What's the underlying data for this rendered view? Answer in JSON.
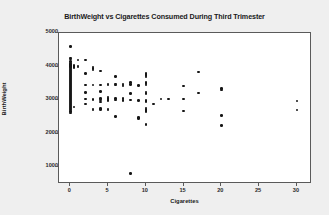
{
  "chart_data": {
    "type": "scatter",
    "title": "BirthWeight vs Cigarettes Consumed During Third Trimester",
    "xlabel": "Cigarettes",
    "ylabel": "BirthWeight",
    "xlim": [
      -1.5,
      32
    ],
    "ylim": [
      500,
      5000
    ],
    "xticks": [
      0,
      5,
      10,
      15,
      20,
      25,
      30
    ],
    "yticks": [
      1000,
      2000,
      3000,
      4000,
      5000
    ],
    "xtick_labels": [
      "0",
      "5",
      "10",
      "15",
      "20",
      "25",
      "30"
    ],
    "ytick_labels": [
      "1000",
      "2000",
      "3000",
      "4000",
      "5000"
    ],
    "grid": false,
    "legend": "none",
    "marker": "filled-circle",
    "marker_color": "#161616",
    "plot_background": "#ffffff",
    "figure_background": "#efefef",
    "points": [
      [
        0,
        4590
      ],
      [
        0,
        4260
      ],
      [
        0,
        4220
      ],
      [
        0,
        4150
      ],
      [
        0,
        4110
      ],
      [
        0,
        4080
      ],
      [
        0,
        4060
      ],
      [
        0,
        4040
      ],
      [
        0,
        4010
      ],
      [
        0,
        3990
      ],
      [
        0,
        3960
      ],
      [
        0,
        3930
      ],
      [
        0,
        3900
      ],
      [
        0,
        3870
      ],
      [
        0,
        3840
      ],
      [
        0,
        3810
      ],
      [
        0,
        3780
      ],
      [
        0,
        3750
      ],
      [
        0,
        3720
      ],
      [
        0,
        3690
      ],
      [
        0,
        3660
      ],
      [
        0,
        3630
      ],
      [
        0,
        3600
      ],
      [
        0,
        3570
      ],
      [
        0,
        3540
      ],
      [
        0,
        3510
      ],
      [
        0,
        3480
      ],
      [
        0,
        3450
      ],
      [
        0,
        3420
      ],
      [
        0,
        3390
      ],
      [
        0,
        3360
      ],
      [
        0,
        3330
      ],
      [
        0,
        3300
      ],
      [
        0,
        3270
      ],
      [
        0,
        3240
      ],
      [
        0,
        3210
      ],
      [
        0,
        3180
      ],
      [
        0,
        3150
      ],
      [
        0,
        3120
      ],
      [
        0,
        3090
      ],
      [
        0,
        3060
      ],
      [
        0,
        3030
      ],
      [
        0,
        3000
      ],
      [
        0,
        2970
      ],
      [
        0,
        2940
      ],
      [
        0,
        2910
      ],
      [
        0,
        2880
      ],
      [
        0,
        2850
      ],
      [
        0,
        2820
      ],
      [
        0,
        2790
      ],
      [
        0,
        2760
      ],
      [
        0,
        2730
      ],
      [
        0,
        2700
      ],
      [
        0,
        2660
      ],
      [
        0,
        2610
      ],
      [
        0.5,
        4030
      ],
      [
        0.5,
        4000
      ],
      [
        0.5,
        3970
      ],
      [
        0.5,
        2790
      ],
      [
        1,
        4200
      ],
      [
        1,
        4020
      ],
      [
        1,
        3990
      ],
      [
        2,
        4190
      ],
      [
        2,
        3790
      ],
      [
        2,
        3450
      ],
      [
        2,
        3230
      ],
      [
        2,
        3030
      ],
      [
        2,
        2890
      ],
      [
        3,
        3990
      ],
      [
        3,
        3940
      ],
      [
        3,
        3900
      ],
      [
        3,
        3450
      ],
      [
        3,
        3010
      ],
      [
        3,
        2730
      ],
      [
        3,
        2700
      ],
      [
        4,
        3870
      ],
      [
        4,
        3450
      ],
      [
        4,
        3250
      ],
      [
        4,
        3050
      ],
      [
        4,
        3000
      ],
      [
        4,
        2940
      ],
      [
        4,
        2750
      ],
      [
        4,
        2720
      ],
      [
        5,
        3480
      ],
      [
        5,
        3450
      ],
      [
        5,
        3090
      ],
      [
        5,
        3050
      ],
      [
        5,
        3000
      ],
      [
        5,
        2990
      ],
      [
        5,
        2730
      ],
      [
        5,
        2710
      ],
      [
        6,
        3710
      ],
      [
        6,
        3480
      ],
      [
        6,
        3450
      ],
      [
        6,
        3040
      ],
      [
        6,
        3000
      ],
      [
        6,
        2520
      ],
      [
        7,
        3480
      ],
      [
        7,
        3450
      ],
      [
        7,
        3420
      ],
      [
        7,
        3050
      ],
      [
        7,
        2990
      ],
      [
        8,
        3520
      ],
      [
        8,
        3460
      ],
      [
        8,
        3200
      ],
      [
        8,
        3000
      ],
      [
        8,
        820
      ],
      [
        9,
        3440
      ],
      [
        9,
        2990
      ],
      [
        9,
        2480
      ],
      [
        9,
        2460
      ],
      [
        10,
        3800
      ],
      [
        10,
        3760
      ],
      [
        10,
        3730
      ],
      [
        10,
        3690
      ],
      [
        10,
        3520
      ],
      [
        10,
        3490
      ],
      [
        10,
        3450
      ],
      [
        10,
        3240
      ],
      [
        10,
        3200
      ],
      [
        10,
        2990
      ],
      [
        10,
        2960
      ],
      [
        10,
        2760
      ],
      [
        10,
        2720
      ],
      [
        10,
        2690
      ],
      [
        10,
        2660
      ],
      [
        10,
        2280
      ],
      [
        11,
        2890
      ],
      [
        12,
        3030
      ],
      [
        13,
        3030
      ],
      [
        15,
        3420
      ],
      [
        15,
        3030
      ],
      [
        15,
        2670
      ],
      [
        17,
        3840
      ],
      [
        17,
        3210
      ],
      [
        20,
        3350
      ],
      [
        20,
        3300
      ],
      [
        20,
        2540
      ],
      [
        20,
        2250
      ],
      [
        30,
        2970
      ],
      [
        30,
        2700
      ]
    ]
  }
}
